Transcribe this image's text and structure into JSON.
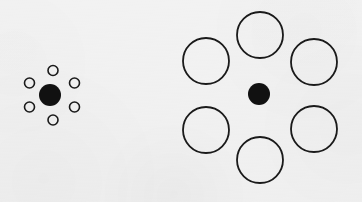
{
  "figure": {
    "name": "ebbinghaus-illusion",
    "alt_title": "Titchener circles",
    "background_color": "#f2f2f2",
    "stroke_color": "#1a1a1a",
    "fill_color": "#111111",
    "canvas": {
      "width": 362,
      "height": 202
    }
  },
  "clusters": [
    {
      "id": "left-cluster",
      "name": "small-surround-cluster",
      "label": "Center disc surrounded by small circles",
      "center": {
        "name": "target-disc-left",
        "cx": 50,
        "cy": 95,
        "r": 11,
        "diameter": 22,
        "fill": "#111111",
        "stroke": "none"
      },
      "surround": {
        "count": 6,
        "r": 5,
        "diameter": 10,
        "orbit_radius": 25,
        "stroke_width": 1.6,
        "fill": "none",
        "circles": [
          {
            "name": "surround-small-1",
            "cx": 53,
            "cy": 70.5,
            "r": 5
          },
          {
            "name": "surround-small-2",
            "cx": 74.5,
            "cy": 83,
            "r": 5
          },
          {
            "name": "surround-small-3",
            "cx": 74.5,
            "cy": 107,
            "r": 5
          },
          {
            "name": "surround-small-4",
            "cx": 53,
            "cy": 120,
            "r": 5
          },
          {
            "name": "surround-small-5",
            "cx": 29.5,
            "cy": 107,
            "r": 5
          },
          {
            "name": "surround-small-6",
            "cx": 29.5,
            "cy": 83,
            "r": 5
          }
        ]
      }
    },
    {
      "id": "right-cluster",
      "name": "large-surround-cluster",
      "label": "Center disc surrounded by large circles",
      "center": {
        "name": "target-disc-right",
        "cx": 259,
        "cy": 94,
        "r": 11,
        "diameter": 22,
        "fill": "#111111",
        "stroke": "none"
      },
      "surround": {
        "count": 6,
        "r": 23,
        "diameter": 46,
        "orbit_radius": 57,
        "stroke_width": 1.8,
        "fill": "none",
        "circles": [
          {
            "name": "surround-large-1",
            "cx": 260,
            "cy": 35,
            "r": 23
          },
          {
            "name": "surround-large-2",
            "cx": 314,
            "cy": 62,
            "r": 23
          },
          {
            "name": "surround-large-3",
            "cx": 314,
            "cy": 129,
            "r": 23
          },
          {
            "name": "surround-large-4",
            "cx": 260,
            "cy": 160,
            "r": 23
          },
          {
            "name": "surround-large-5",
            "cx": 206,
            "cy": 130,
            "r": 23
          },
          {
            "name": "surround-large-6",
            "cx": 206,
            "cy": 61,
            "r": 23
          }
        ]
      }
    }
  ],
  "chart_data": {
    "type": "scatter",
    "xlabel": "",
    "ylabel": "",
    "xlim": [
      0,
      362
    ],
    "ylim": [
      0,
      202
    ],
    "grid": false,
    "legend": "none",
    "series": [
      {
        "name": "target discs",
        "style": "filled",
        "x": [
          50,
          259
        ],
        "y": [
          95,
          94
        ],
        "diameters": [
          22,
          22
        ]
      },
      {
        "name": "small inducers",
        "style": "outline",
        "x": [
          53,
          74.5,
          74.5,
          53,
          29.5,
          29.5
        ],
        "y": [
          70.5,
          83,
          107,
          120,
          107,
          83
        ],
        "diameters": [
          10,
          10,
          10,
          10,
          10,
          10
        ]
      },
      {
        "name": "large inducers",
        "style": "outline",
        "x": [
          260,
          314,
          314,
          260,
          206,
          206
        ],
        "y": [
          35,
          62,
          129,
          160,
          130,
          61
        ],
        "diameters": [
          46,
          46,
          46,
          46,
          46,
          46
        ]
      }
    ],
    "annotations": []
  }
}
